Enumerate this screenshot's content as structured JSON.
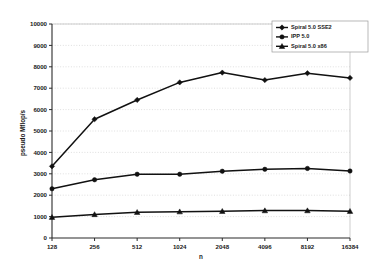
{
  "chart_data": {
    "type": "line",
    "title": "",
    "xlabel": "n",
    "ylabel": "pseudo Mflop/s",
    "categories": [
      "128",
      "256",
      "512",
      "1024",
      "2048",
      "4096",
      "8192",
      "16384"
    ],
    "x": [
      128,
      256,
      512,
      1024,
      2048,
      4096,
      8192,
      16384
    ],
    "xscale": "categorical",
    "ylim": [
      0,
      10000
    ],
    "ytick_labels": [
      "0",
      "1000",
      "2000",
      "3000",
      "4000",
      "5000",
      "6000",
      "7000",
      "8000",
      "9000",
      "10000"
    ],
    "yticks": [
      0,
      1000,
      2000,
      3000,
      4000,
      5000,
      6000,
      7000,
      8000,
      9000,
      10000
    ],
    "grid": "horizontal-dotted",
    "legend_position": "top-right",
    "series": [
      {
        "name": "Spiral 5.0 SSE2",
        "marker": "diamond",
        "color": "#111111",
        "values": [
          3350,
          5550,
          6450,
          7270,
          7730,
          7380,
          7700,
          7480
        ]
      },
      {
        "name": "IPP 5.0",
        "marker": "circle",
        "color": "#111111",
        "values": [
          2300,
          2720,
          2980,
          2980,
          3120,
          3210,
          3250,
          3130
        ]
      },
      {
        "name": "Spiral 5.0 x86",
        "marker": "triangle",
        "color": "#111111",
        "values": [
          970,
          1100,
          1200,
          1230,
          1250,
          1280,
          1280,
          1250
        ]
      }
    ]
  }
}
